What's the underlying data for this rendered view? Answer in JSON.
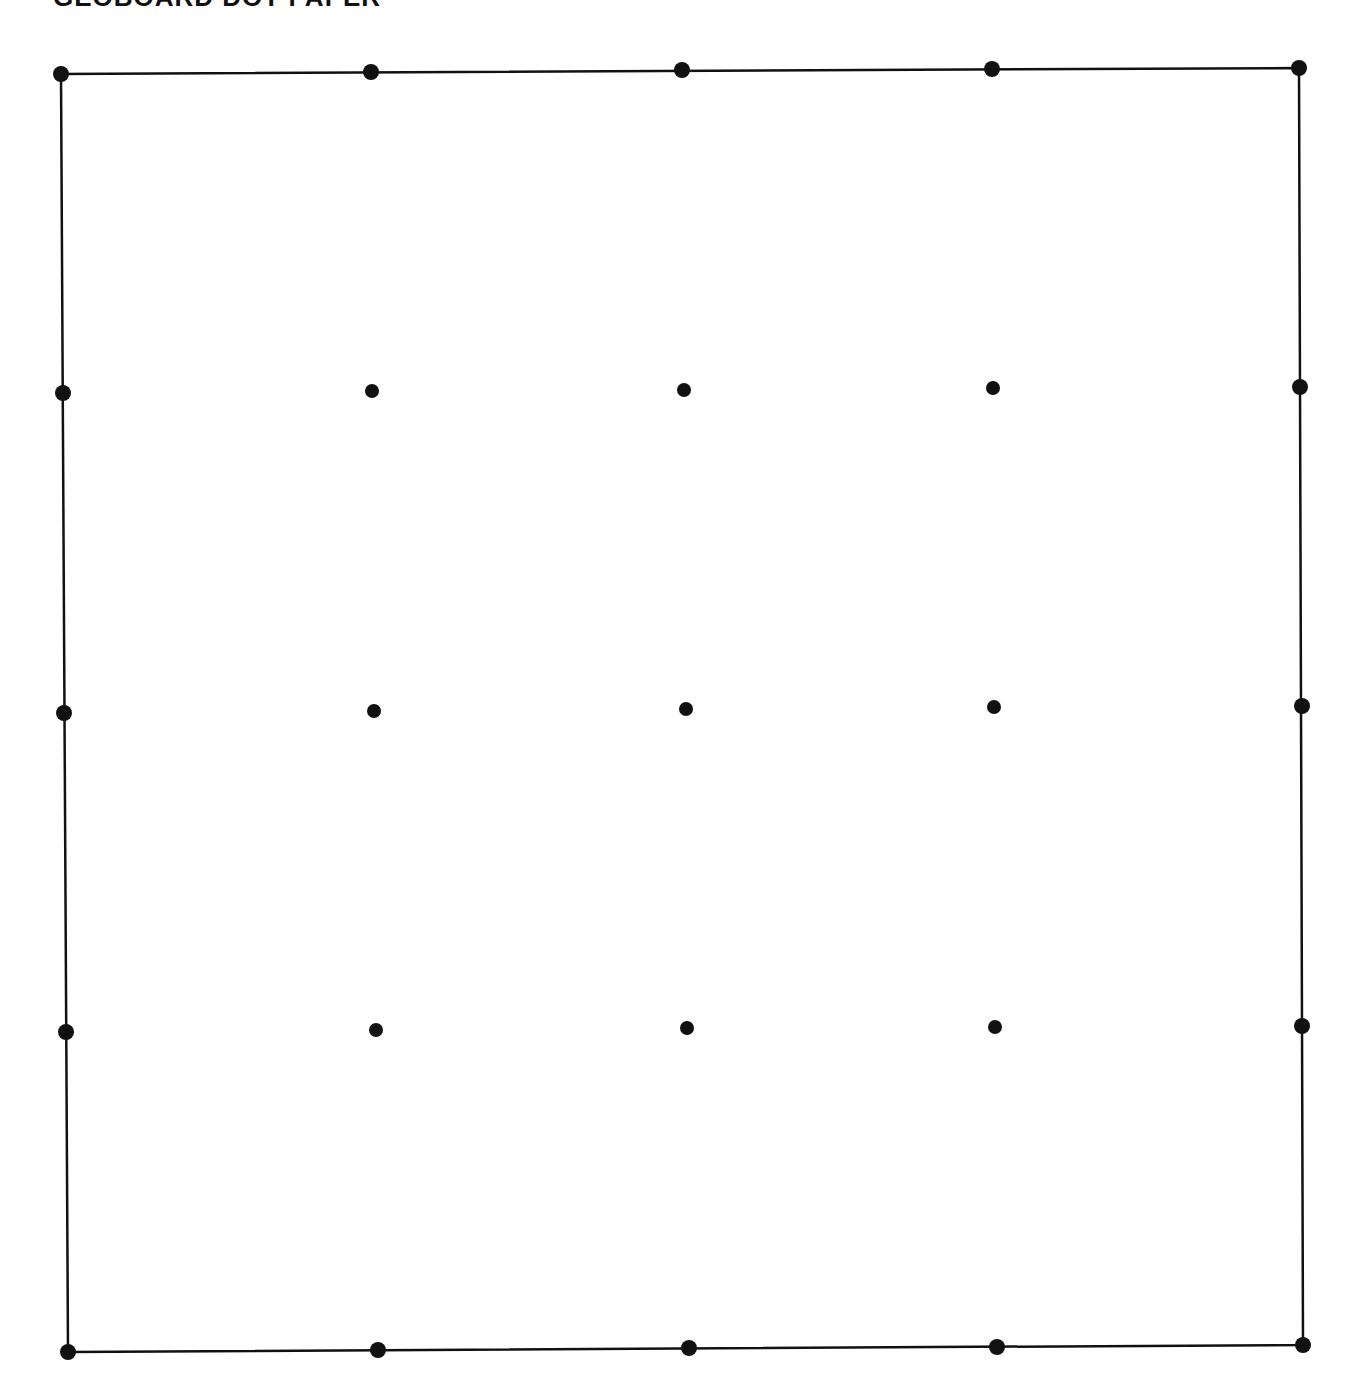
{
  "title": "GEOBOARD DOT PAPER",
  "colors": {
    "ink": "#111111",
    "background": "#ffffff"
  },
  "grid": {
    "rows": 5,
    "cols": 5,
    "dots": [
      [
        [
          61,
          74
        ],
        [
          371,
          72
        ],
        [
          682,
          70
        ],
        [
          992,
          69
        ],
        [
          1299,
          68
        ]
      ],
      [
        [
          63,
          393
        ],
        [
          372,
          391
        ],
        [
          684,
          390
        ],
        [
          993,
          388
        ],
        [
          1300,
          387
        ]
      ],
      [
        [
          64,
          713
        ],
        [
          374,
          711
        ],
        [
          686,
          709
        ],
        [
          994,
          707
        ],
        [
          1302,
          706
        ]
      ],
      [
        [
          66,
          1032
        ],
        [
          376,
          1030
        ],
        [
          687,
          1028
        ],
        [
          995,
          1027
        ],
        [
          1302,
          1026
        ]
      ],
      [
        [
          68,
          1352
        ],
        [
          378,
          1350
        ],
        [
          689,
          1348
        ],
        [
          997,
          1347
        ],
        [
          1303,
          1345
        ]
      ]
    ],
    "border": [
      [
        61,
        74
      ],
      [
        1299,
        68
      ],
      [
        1303,
        1345
      ],
      [
        68,
        1352
      ]
    ],
    "dot_radius": 7,
    "corner_radius": 8
  }
}
